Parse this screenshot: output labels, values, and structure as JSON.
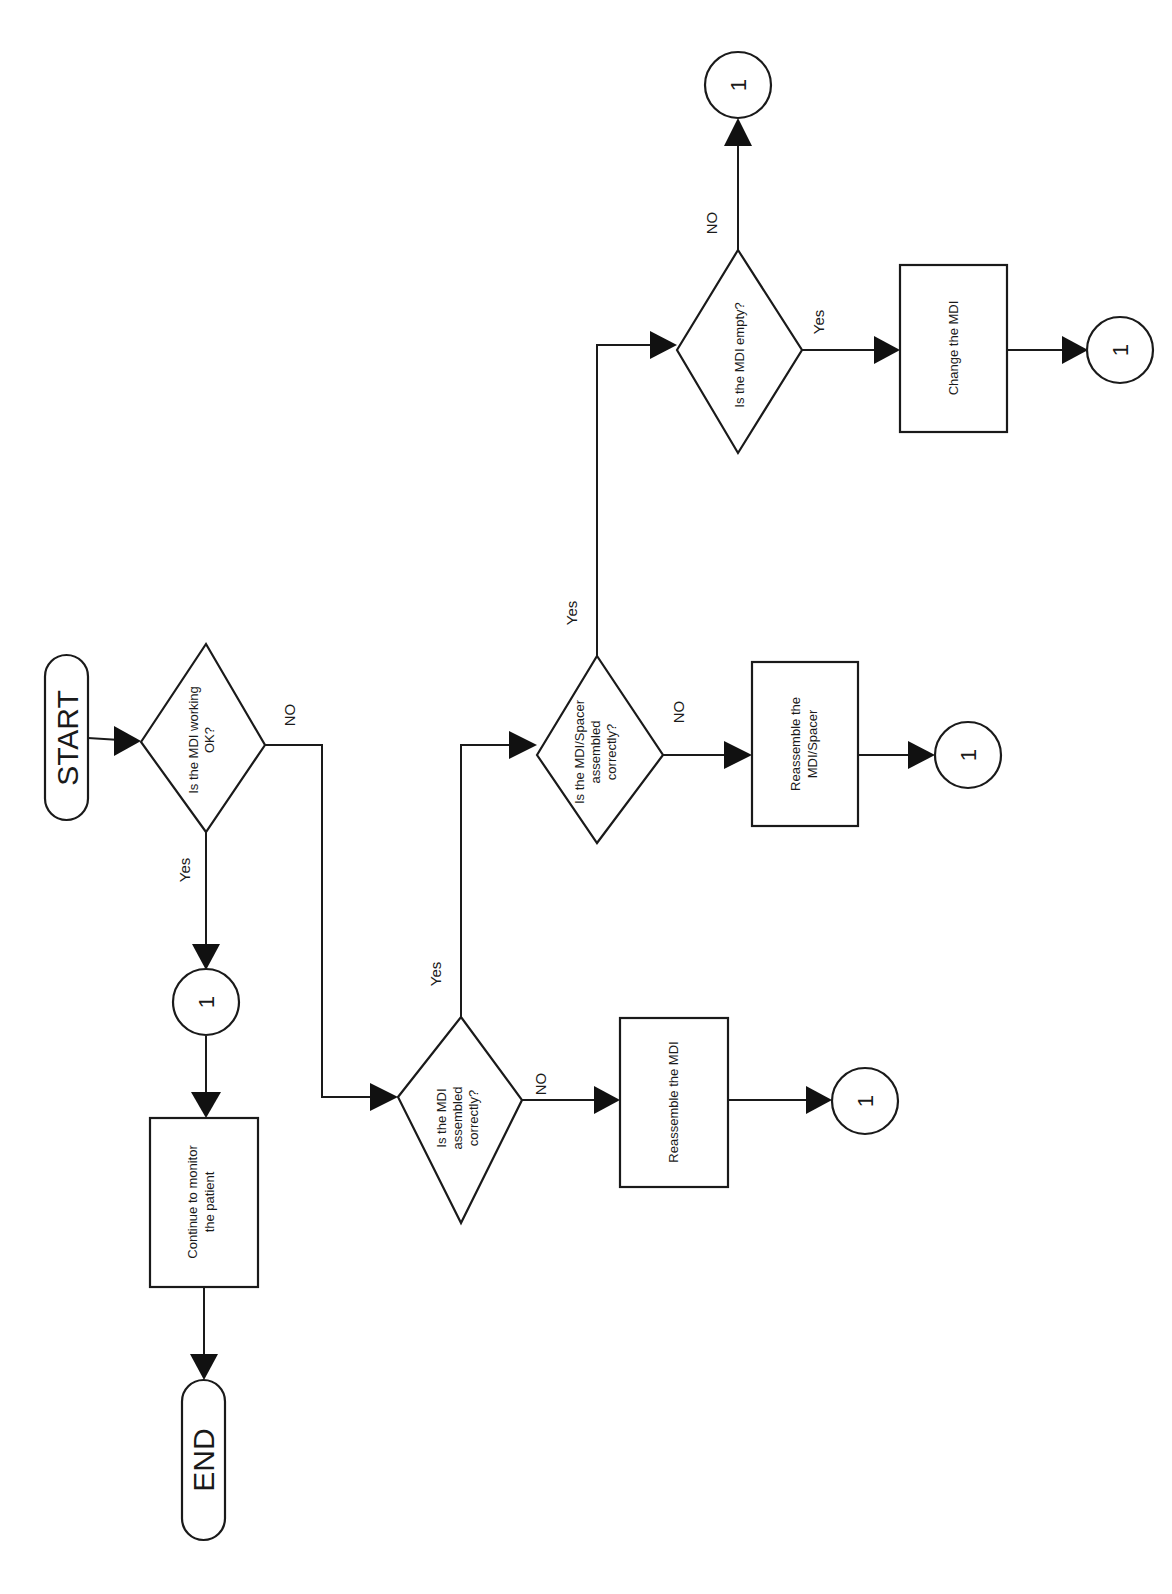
{
  "diagram": {
    "type": "flowchart",
    "orientation": "rotated-90-ccw",
    "colors": {
      "stroke": "#1a1a1a",
      "fill": "#ffffff",
      "arrow": "#111111",
      "background": "#ffffff"
    },
    "terminals": {
      "start": "START",
      "end": "END"
    },
    "decisions": {
      "mdi_working": {
        "line1": "Is the MDI working",
        "line2": "OK?"
      },
      "mdi_assembled": {
        "line1": "Is the MDI",
        "line2": "assembled",
        "line3": "correctly?"
      },
      "spacer_assembled": {
        "line1": "Is the MDI/Spacer",
        "line2": "assembled",
        "line3": "correctly?"
      },
      "mdi_empty": {
        "line1": "Is the MDI empty?"
      }
    },
    "processes": {
      "continue_monitor": {
        "line1": "Continue to monitor",
        "line2": "the patient"
      },
      "reassemble_mdi": {
        "line1": "Reassemble the MDI"
      },
      "reassemble_spacer": {
        "line1": "Reassemble the",
        "line2": "MDI/Spacer"
      },
      "change_mdi": {
        "line1": "Change the MDI"
      }
    },
    "connectors": {
      "label": "1"
    },
    "edge_labels": {
      "yes": "Yes",
      "no": "NO"
    }
  }
}
